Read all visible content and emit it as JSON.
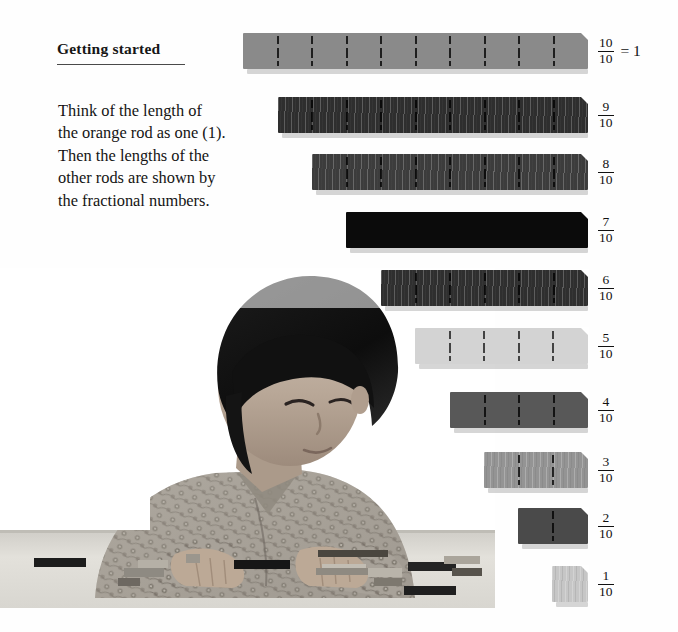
{
  "page": {
    "heading": "Getting started",
    "paragraph_lines": [
      "Think of the length of",
      "the orange rod as one (1).",
      "Then the lengths of the",
      "other rods are shown by",
      "the fractional numbers."
    ]
  },
  "photo": {
    "alt": "Black and white photograph of a child in a patterned shirt working with Cuisenaire rods on a table"
  },
  "rod_chart": {
    "type": "bar",
    "title": "Getting started",
    "orientation": "horizontal",
    "unit_note": "The orange rod (10/10) represents one (1).",
    "denominator": 10,
    "rods": [
      {
        "label_numerator": "10",
        "label_denominator": "10",
        "equals": "= 1",
        "value": 1.0,
        "segments": 10,
        "color": "#8a8a8a",
        "texture": "smooth",
        "width_px": 345,
        "left_px": 243,
        "top_px": 33,
        "height_px": 36
      },
      {
        "label_numerator": "9",
        "label_denominator": "10",
        "equals": "",
        "value": 0.9,
        "segments": 9,
        "color": "#2e2e2e",
        "texture": "grain",
        "width_px": 310,
        "left_px": 278,
        "top_px": 97,
        "height_px": 36
      },
      {
        "label_numerator": "8",
        "label_denominator": "10",
        "equals": "",
        "value": 0.8,
        "segments": 8,
        "color": "#3c3c3c",
        "texture": "grain",
        "width_px": 276,
        "left_px": 312,
        "top_px": 154,
        "height_px": 36
      },
      {
        "label_numerator": "7",
        "label_denominator": "10",
        "equals": "",
        "value": 0.7,
        "segments": 1,
        "color": "#0b0b0b",
        "texture": "smooth",
        "width_px": 242,
        "left_px": 346,
        "top_px": 212,
        "height_px": 36
      },
      {
        "label_numerator": "6",
        "label_denominator": "10",
        "equals": "",
        "value": 0.6,
        "segments": 6,
        "color": "#2f2f2f",
        "texture": "grain",
        "width_px": 207,
        "left_px": 381,
        "top_px": 270,
        "height_px": 36
      },
      {
        "label_numerator": "5",
        "label_denominator": "10",
        "equals": "",
        "value": 0.5,
        "segments": 5,
        "color": "#d3d3d3",
        "texture": "smooth",
        "width_px": 173,
        "left_px": 415,
        "top_px": 328,
        "height_px": 36
      },
      {
        "label_numerator": "4",
        "label_denominator": "10",
        "equals": "",
        "value": 0.4,
        "segments": 4,
        "color": "#585858",
        "texture": "smooth",
        "width_px": 138,
        "left_px": 450,
        "top_px": 392,
        "height_px": 36
      },
      {
        "label_numerator": "3",
        "label_denominator": "10",
        "equals": "",
        "value": 0.3,
        "segments": 3,
        "color": "#949494",
        "texture": "grain",
        "width_px": 104,
        "left_px": 484,
        "top_px": 452,
        "height_px": 36
      },
      {
        "label_numerator": "2",
        "label_denominator": "10",
        "equals": "",
        "value": 0.2,
        "segments": 2,
        "color": "#4a4a4a",
        "texture": "smooth",
        "width_px": 70,
        "left_px": 518,
        "top_px": 508,
        "height_px": 36
      },
      {
        "label_numerator": "1",
        "label_denominator": "10",
        "equals": "",
        "value": 0.1,
        "segments": 1,
        "color": "#c6c6c6",
        "texture": "grain",
        "width_px": 36,
        "left_px": 552,
        "top_px": 566,
        "height_px": 36
      }
    ]
  }
}
